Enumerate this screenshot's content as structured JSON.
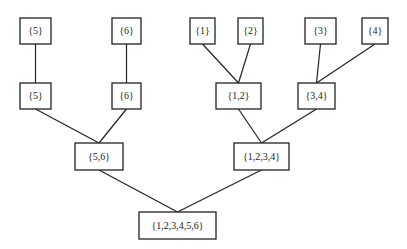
{
  "diagram": {
    "type": "merge-tree",
    "nodes": [
      {
        "id": "t5",
        "label": "{5}",
        "x": 20,
        "y": 18,
        "w": 31,
        "h": 26
      },
      {
        "id": "t6",
        "label": "{6}",
        "x": 112,
        "y": 18,
        "w": 29,
        "h": 26
      },
      {
        "id": "t1",
        "label": "{1}",
        "x": 190,
        "y": 18,
        "w": 25,
        "h": 26
      },
      {
        "id": "t2",
        "label": "{2}",
        "x": 238,
        "y": 18,
        "w": 25,
        "h": 26
      },
      {
        "id": "t3",
        "label": "{3}",
        "x": 305,
        "y": 18,
        "w": 31,
        "h": 26
      },
      {
        "id": "t4",
        "label": "{4}",
        "x": 362,
        "y": 18,
        "w": 26,
        "h": 26
      },
      {
        "id": "m5",
        "label": "{5}",
        "x": 20,
        "y": 83,
        "w": 31,
        "h": 26
      },
      {
        "id": "m6",
        "label": "{6}",
        "x": 112,
        "y": 83,
        "w": 29,
        "h": 26
      },
      {
        "id": "m12",
        "label": "{1,2}",
        "x": 216,
        "y": 83,
        "w": 45,
        "h": 26
      },
      {
        "id": "m34",
        "label": "{3,4}",
        "x": 298,
        "y": 83,
        "w": 37,
        "h": 26
      },
      {
        "id": "n56",
        "label": "{5,6}",
        "x": 75,
        "y": 143,
        "w": 48,
        "h": 27
      },
      {
        "id": "n1234",
        "label": "{1,2,3,4}",
        "x": 234,
        "y": 143,
        "w": 55,
        "h": 27
      },
      {
        "id": "root",
        "label": "{1,2,3,4,5,6}",
        "x": 139,
        "y": 212,
        "w": 77,
        "h": 27
      }
    ],
    "edges": [
      {
        "from": "t5",
        "to": "m5"
      },
      {
        "from": "t6",
        "to": "m6"
      },
      {
        "from": "t1",
        "to": "m12"
      },
      {
        "from": "t2",
        "to": "m12"
      },
      {
        "from": "t3",
        "to": "m34"
      },
      {
        "from": "t4",
        "to": "m34"
      },
      {
        "from": "m5",
        "to": "n56"
      },
      {
        "from": "m6",
        "to": "n56"
      },
      {
        "from": "m12",
        "to": "n1234"
      },
      {
        "from": "m34",
        "to": "n1234"
      },
      {
        "from": "n56",
        "to": "root"
      },
      {
        "from": "n1234",
        "to": "root"
      }
    ]
  }
}
